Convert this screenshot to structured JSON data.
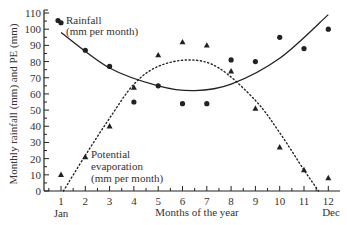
{
  "chart_data": {
    "type": "scatter",
    "title": "",
    "xlabel": "Months of the year",
    "ylabel": "Monthly rainfall (mm) and PE (mm)",
    "x": [
      1,
      2,
      3,
      4,
      5,
      6,
      7,
      8,
      9,
      10,
      11,
      12
    ],
    "x_tick_labels": [
      "1",
      "2",
      "3",
      "4",
      "5",
      "6",
      "7",
      "8",
      "9",
      "10",
      "11",
      "12"
    ],
    "x_end_labels": {
      "start": "Jan",
      "end": "Dec"
    },
    "y_ticks": [
      0,
      10,
      20,
      30,
      40,
      50,
      60,
      70,
      80,
      90,
      100,
      110
    ],
    "xlim": [
      0.5,
      12.7
    ],
    "ylim": [
      0,
      112
    ],
    "grid": false,
    "legend": "inline annotations",
    "series": [
      {
        "name": "Rainfall (mm per month)",
        "marker": "circle",
        "values": [
          104,
          87,
          77,
          55,
          65,
          54,
          54,
          81,
          80,
          95,
          88,
          100
        ],
        "trend": "solid curve (U-shaped quadratic fit)",
        "trend_points": [
          [
            1,
            98
          ],
          [
            3,
            76
          ],
          [
            5,
            65
          ],
          [
            6.5,
            62
          ],
          [
            8,
            66
          ],
          [
            10,
            82
          ],
          [
            12,
            109
          ]
        ]
      },
      {
        "name": "Potential evaporation (mm per month)",
        "marker": "triangle",
        "values": [
          10,
          21,
          40,
          64,
          84,
          92,
          90,
          74,
          51,
          27,
          13,
          8
        ],
        "trend": "dotted curve (inverted-U quadratic fit)",
        "trend_points": [
          [
            1.1,
            0
          ],
          [
            2,
            22
          ],
          [
            3,
            45
          ],
          [
            4,
            66
          ],
          [
            5,
            77
          ],
          [
            6.3,
            81
          ],
          [
            7.5,
            76
          ],
          [
            9,
            56
          ],
          [
            10,
            36
          ],
          [
            11,
            13
          ],
          [
            11.6,
            0
          ]
        ]
      }
    ],
    "annotations": [
      {
        "text_lines": [
          "Rainfall",
          "(mm per month)"
        ],
        "near": "Jan rainfall point"
      },
      {
        "text_lines": [
          "Potential",
          "evaporation",
          "(mm per month)"
        ],
        "near": "Feb PE point"
      }
    ]
  },
  "labels": {
    "ylabel": "Monthly rainfall (mm) and PE (mm)",
    "xlabel": "Months of the year",
    "jan": "Jan",
    "dec": "Dec",
    "rain_line1": "Rainfall",
    "rain_line2": "(mm per month)",
    "pe_line1": "Potential",
    "pe_line2": "evaporation",
    "pe_line3": "(mm per month)"
  },
  "colors": {
    "ink": "#222222",
    "background": "#ffffff"
  }
}
